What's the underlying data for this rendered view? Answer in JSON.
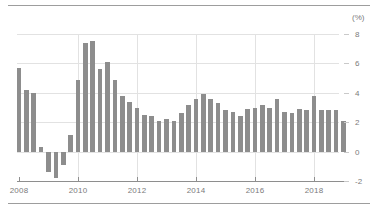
{
  "figure": {
    "unit_label": "(%)",
    "bar_color": "#8d8d8d",
    "gridline_color": "#e2e2e2",
    "axis_color": "#8e8e8e",
    "label_color": "#7b7b7b",
    "background": "#ffffff"
  },
  "chart_data": {
    "type": "bar",
    "title": "",
    "subtitle": "",
    "xlabel": "",
    "ylabel": "",
    "unit": "(%)",
    "grid": true,
    "legend": "none",
    "orientation": "vertical",
    "ylim": [
      -2,
      8
    ],
    "yticks": [
      -2,
      0,
      2,
      4,
      6,
      8
    ],
    "ytick_labels": [
      "-2",
      "0",
      "2",
      "4",
      "6",
      "8"
    ],
    "xticks": [
      2008,
      2010,
      2012,
      2014,
      2016,
      2018
    ],
    "xtick_labels": [
      "2008",
      "2010",
      "2012",
      "2014",
      "2016",
      "2018"
    ],
    "x_frequency": "quarterly",
    "x_start": "2008 Q1",
    "x_end": "2018 Q4",
    "categories": [
      "2008 Q1",
      "2008 Q2",
      "2008 Q3",
      "2008 Q4",
      "2009 Q1",
      "2009 Q2",
      "2009 Q3",
      "2009 Q4",
      "2010 Q1",
      "2010 Q2",
      "2010 Q3",
      "2010 Q4",
      "2011 Q1",
      "2011 Q2",
      "2011 Q3",
      "2011 Q4",
      "2012 Q1",
      "2012 Q2",
      "2012 Q3",
      "2012 Q4",
      "2013 Q1",
      "2013 Q2",
      "2013 Q3",
      "2013 Q4",
      "2014 Q1",
      "2014 Q2",
      "2014 Q3",
      "2014 Q4",
      "2015 Q1",
      "2015 Q2",
      "2015 Q3",
      "2015 Q4",
      "2016 Q1",
      "2016 Q2",
      "2016 Q3",
      "2016 Q4",
      "2017 Q1",
      "2017 Q2",
      "2017 Q3",
      "2017 Q4",
      "2018 Q1",
      "2018 Q2",
      "2018 Q3",
      "2018 Q4"
    ],
    "values": [
      5.7,
      4.2,
      4.0,
      0.3,
      -1.4,
      -1.8,
      -0.9,
      1.1,
      4.9,
      7.4,
      7.5,
      5.6,
      6.1,
      4.9,
      3.8,
      3.4,
      3.0,
      2.5,
      2.4,
      2.1,
      2.2,
      2.1,
      2.6,
      3.2,
      3.6,
      3.9,
      3.6,
      3.3,
      2.8,
      2.7,
      2.4,
      2.9,
      3.0,
      3.2,
      3.0,
      3.6,
      2.7,
      2.6,
      2.9,
      2.8,
      3.8,
      2.8,
      2.8,
      2.8
    ],
    "values_tail_extra": [
      2.1
    ]
  }
}
